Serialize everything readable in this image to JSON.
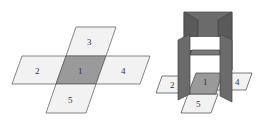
{
  "diagram": {
    "left_net": {
      "faces": [
        {
          "id": "1",
          "label": "1",
          "shade": "#9a9a9a"
        },
        {
          "id": "2",
          "label": "2",
          "shade": "#f2f2f2"
        },
        {
          "id": "3",
          "label": "3",
          "shade": "#f2f2f2"
        },
        {
          "id": "4",
          "label": "4",
          "shade": "#f2f2f2"
        },
        {
          "id": "5",
          "label": "5",
          "shade": "#f2f2f2"
        }
      ]
    },
    "right_folded": {
      "labels": [
        "2",
        "1",
        "4",
        "5"
      ],
      "wall_color": "#6e6e6e",
      "base_color": "#9a9a9a"
    },
    "colors": {
      "outline": "#555555",
      "light_face": "#f2f2f2",
      "center_face": "#9a9a9a",
      "wall": "#6b6b6b"
    }
  }
}
